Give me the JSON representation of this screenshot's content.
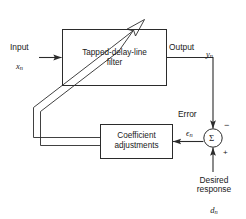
{
  "diagram": {
    "stroke_color": "#2b2b2b",
    "background_color": "#ffffff"
  },
  "blocks": [
    {
      "id": "filter",
      "name": "tapped-delay-line-filter-block",
      "line1": "Tapped-delay-line",
      "line2": "filter"
    },
    {
      "id": "coefficients",
      "name": "coefficient-adjustments-block",
      "line1": "Coefficient",
      "line2": "adjustments"
    }
  ],
  "summing_junction": {
    "name": "summing-junction",
    "symbol": "Σ",
    "negative_sign": "−",
    "positive_sign": "+"
  },
  "labels": {
    "input": {
      "text": "Input",
      "signal": "x",
      "subscript": "n"
    },
    "output": {
      "text": "Output",
      "signal": "y",
      "subscript": "n"
    },
    "error": {
      "text": "Error",
      "signal": "ϵ",
      "subscript": "n"
    },
    "desired": {
      "line1": "Desired",
      "line2": "response",
      "signal": "d",
      "subscript": "n"
    }
  },
  "connections": [
    {
      "name": "input-to-filter-arrow",
      "from": "input",
      "to": "filter"
    },
    {
      "name": "filter-to-output-line",
      "from": "filter",
      "to": "output-node"
    },
    {
      "name": "output-to-summer-arrow",
      "from": "output-node",
      "to": "summing-junction"
    },
    {
      "name": "desired-to-summer-arrow",
      "from": "desired-response",
      "to": "summing-junction"
    },
    {
      "name": "error-to-coefficients-arrow",
      "from": "summing-junction",
      "to": "coefficients"
    },
    {
      "name": "coefficients-bus-to-filter-arrow",
      "from": "coefficients",
      "to": "filter"
    }
  ]
}
